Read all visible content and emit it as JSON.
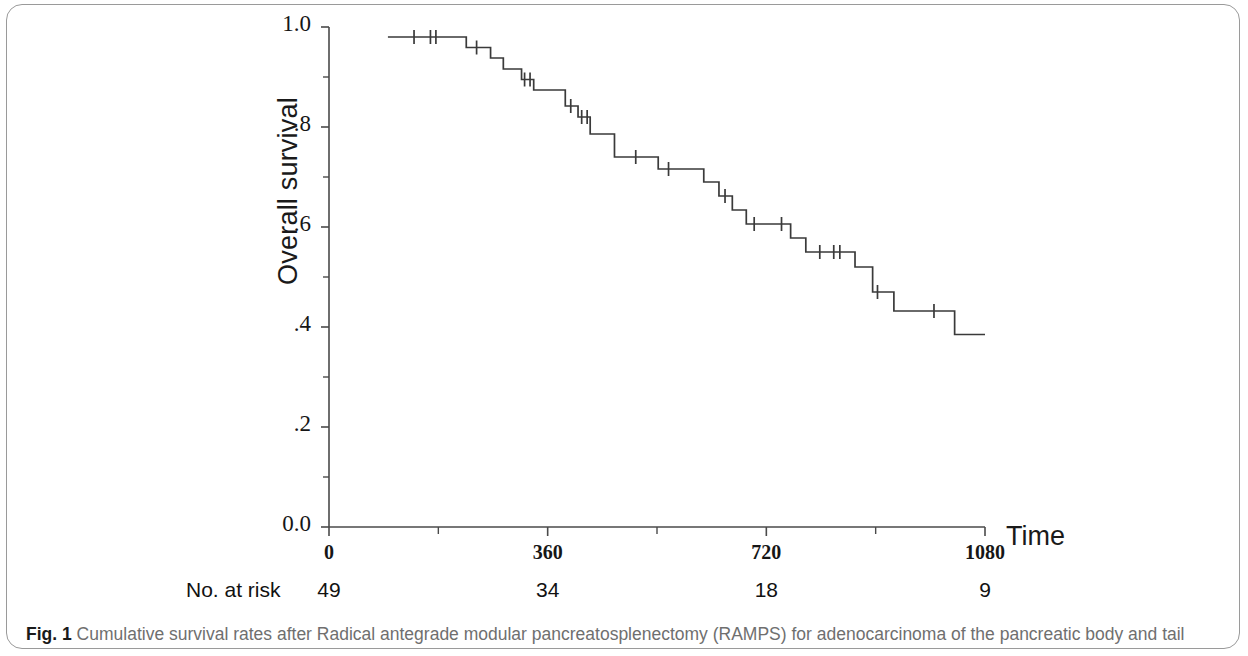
{
  "figure": {
    "caption_label": "Fig. 1",
    "caption_text": "Cumulative survival rates after Radical antegrade modular pancreatosplenectomy (RAMPS) for adenocarcinoma of the pancreatic body and tail"
  },
  "axes": {
    "y_title": "Overall survival",
    "x_title": "Time",
    "y_tick_labels": [
      "1.0",
      ".8",
      ".6",
      ".4",
      ".2",
      "0.0"
    ],
    "y_tick_values": [
      1.0,
      0.8,
      0.6,
      0.4,
      0.2,
      0.0
    ],
    "y_minor_tick_values": [
      0.9,
      0.7,
      0.5,
      0.3,
      0.1
    ],
    "x_tick_labels": [
      "0",
      "360",
      "720",
      "1080"
    ],
    "x_tick_values": [
      0,
      360,
      720,
      1080
    ],
    "x_minor_tick_values": [
      180,
      540,
      900
    ]
  },
  "risk_table": {
    "label": "No. at risk",
    "times": [
      0,
      360,
      720,
      1080
    ],
    "counts": [
      "49",
      "34",
      "18",
      "9"
    ]
  },
  "chart_data": {
    "type": "line",
    "subtype": "kaplan-meier-step",
    "xlabel": "Time",
    "ylabel": "Overall survival",
    "xlim": [
      0,
      1120
    ],
    "ylim": [
      0.0,
      1.0
    ],
    "grid": false,
    "legend": null,
    "series": [
      {
        "name": "Overall survival (RAMPS)",
        "color": "#3a3a3a",
        "n_at_start": 49,
        "step_points": [
          [
            97,
            0.98
          ],
          [
            226,
            0.98
          ],
          [
            226,
            0.959
          ],
          [
            266,
            0.959
          ],
          [
            266,
            0.938
          ],
          [
            287,
            0.938
          ],
          [
            287,
            0.916
          ],
          [
            317,
            0.916
          ],
          [
            317,
            0.895
          ],
          [
            337,
            0.895
          ],
          [
            337,
            0.874
          ],
          [
            389,
            0.874
          ],
          [
            389,
            0.842
          ],
          [
            410,
            0.842
          ],
          [
            410,
            0.82
          ],
          [
            430,
            0.82
          ],
          [
            430,
            0.786
          ],
          [
            470,
            0.786
          ],
          [
            470,
            0.74
          ],
          [
            542,
            0.74
          ],
          [
            542,
            0.716
          ],
          [
            617,
            0.716
          ],
          [
            617,
            0.69
          ],
          [
            642,
            0.69
          ],
          [
            642,
            0.662
          ],
          [
            664,
            0.662
          ],
          [
            664,
            0.634
          ],
          [
            687,
            0.634
          ],
          [
            687,
            0.606
          ],
          [
            760,
            0.606
          ],
          [
            760,
            0.578
          ],
          [
            785,
            0.578
          ],
          [
            785,
            0.55
          ],
          [
            866,
            0.55
          ],
          [
            866,
            0.52
          ],
          [
            895,
            0.52
          ],
          [
            895,
            0.47
          ],
          [
            930,
            0.47
          ],
          [
            930,
            0.432
          ],
          [
            1030,
            0.432
          ],
          [
            1030,
            0.385
          ],
          [
            1080,
            0.385
          ]
        ],
        "censor_marks": [
          [
            140,
            0.98
          ],
          [
            167,
            0.98
          ],
          [
            176,
            0.98
          ],
          [
            243,
            0.959
          ],
          [
            322,
            0.895
          ],
          [
            331,
            0.895
          ],
          [
            398,
            0.842
          ],
          [
            416,
            0.82
          ],
          [
            425,
            0.82
          ],
          [
            505,
            0.74
          ],
          [
            559,
            0.716
          ],
          [
            652,
            0.662
          ],
          [
            700,
            0.606
          ],
          [
            745,
            0.606
          ],
          [
            808,
            0.55
          ],
          [
            831,
            0.55
          ],
          [
            841,
            0.55
          ],
          [
            903,
            0.47
          ],
          [
            996,
            0.432
          ]
        ]
      }
    ]
  }
}
